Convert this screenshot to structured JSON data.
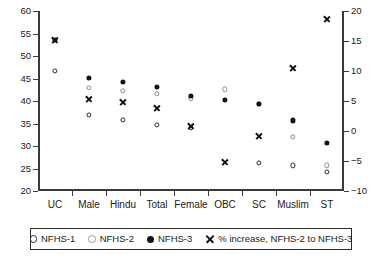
{
  "chart_data": {
    "type": "scatter",
    "title": "",
    "subtitle": "",
    "xlabel": "",
    "ylabel": "",
    "y2label": "",
    "grid": false,
    "legend_position": "bottom",
    "categories": [
      "UC",
      "Male",
      "Hindu",
      "Total",
      "Female",
      "OBC",
      "SC",
      "Muslim",
      "ST"
    ],
    "ylim": [
      20,
      60
    ],
    "yticks": [
      20,
      25,
      30,
      35,
      40,
      45,
      50,
      55,
      60
    ],
    "y2lim": [
      -10,
      20
    ],
    "y2ticks": [
      -10,
      -5,
      0,
      5,
      10,
      15,
      20
    ],
    "series": [
      {
        "name": "NFHS-1",
        "marker": "open-circle-black",
        "axis": "left",
        "values": [
          46.7,
          36.9,
          35.8,
          34.7,
          34.0,
          null,
          26.3,
          25.7,
          24.2
        ]
      },
      {
        "name": "NFHS-2",
        "marker": "open-circle-grey",
        "axis": "left",
        "values": [
          null,
          42.9,
          42.2,
          41.6,
          40.6,
          42.6,
          39.4,
          32.1,
          25.7
        ]
      },
      {
        "name": "NFHS-3",
        "marker": "filled-circle",
        "axis": "left",
        "values": [
          53.6,
          45.2,
          44.2,
          43.2,
          41.1,
          40.2,
          39.3,
          35.7,
          30.7
        ]
      },
      {
        "name": "% increase, NFHS-2 to NFHS-3",
        "marker": "cross-x",
        "axis": "right",
        "values": [
          15.2,
          5.4,
          4.8,
          3.8,
          0.8,
          -5.2,
          -0.9,
          10.5,
          18.6
        ]
      }
    ]
  },
  "legend": {
    "entries": [
      {
        "label": "NFHS-1",
        "icon": "open-circle-black-icon"
      },
      {
        "label": "NFHS-2",
        "icon": "open-circle-grey-icon"
      },
      {
        "label": "NFHS-3",
        "icon": "filled-circle-icon"
      },
      {
        "label": "% increase, NFHS-2 to NFHS-3",
        "icon": "cross-x-icon"
      }
    ]
  }
}
